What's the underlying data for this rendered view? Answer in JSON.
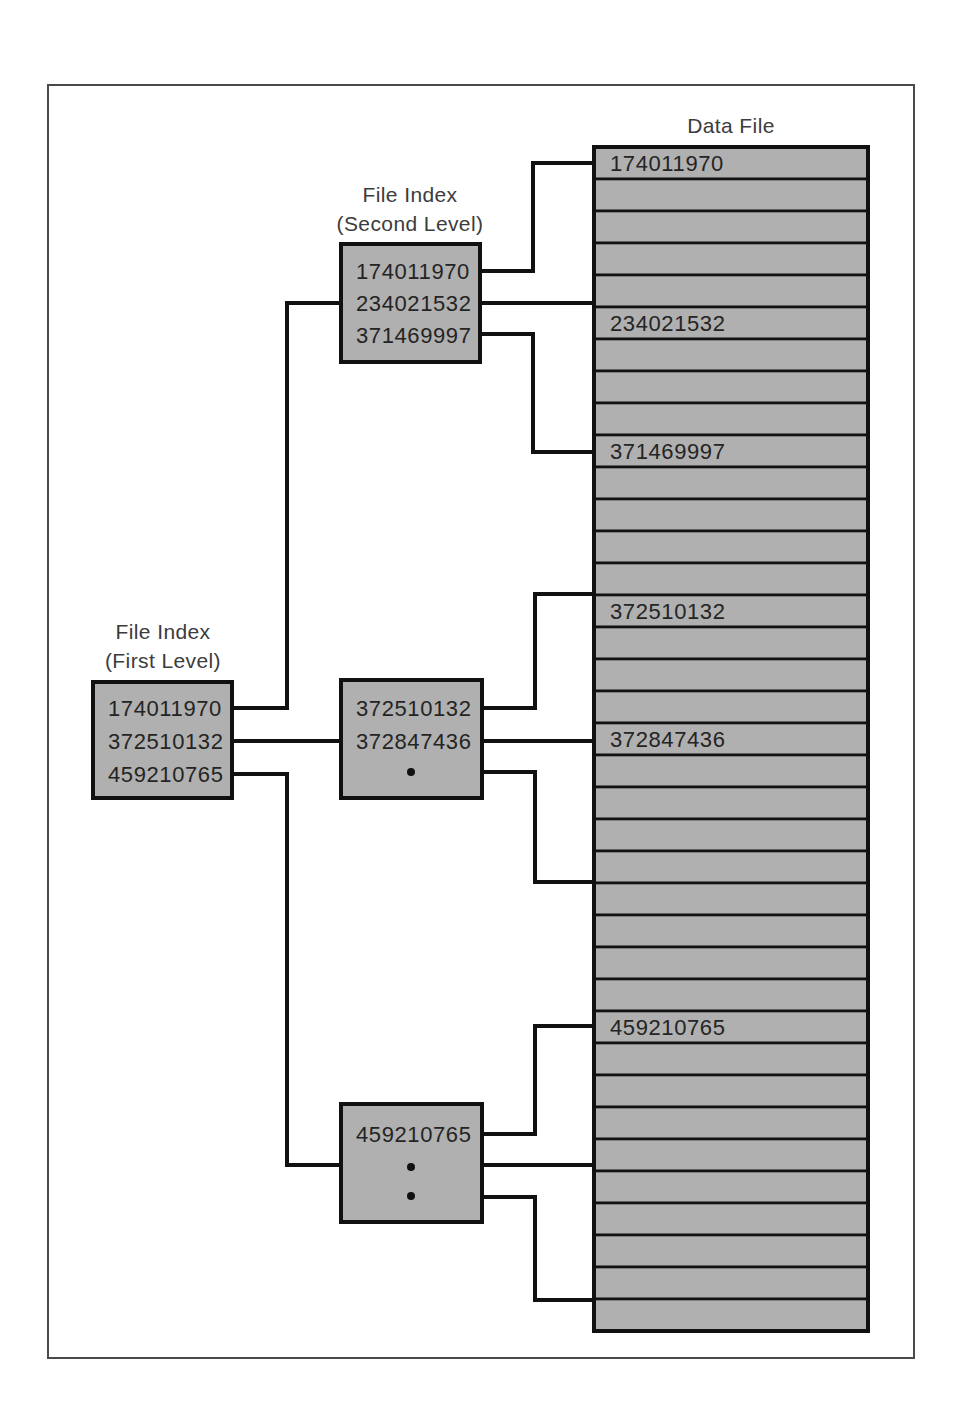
{
  "diagram": {
    "title_labels": {
      "first_level": "File Index\n(First Level)",
      "first_level_line1": "File Index",
      "first_level_line2": "(First Level)",
      "second_level_line1": "File Index",
      "second_level_line2": "(Second Level)",
      "data_file": "Data File"
    },
    "colors": {
      "box_fill": "#b0b0b0",
      "box_stroke": "#111111",
      "frame_stroke": "#4a4a4a",
      "text": "#242424",
      "caption_text": "#3c3c3c",
      "background": "#ffffff"
    },
    "first_level_index": {
      "caption_line1": "File Index",
      "caption_line2": "(First Level)",
      "entries": [
        {
          "label": "174011970",
          "kind": "key"
        },
        {
          "label": "372510132",
          "kind": "key"
        },
        {
          "label": "459210765",
          "kind": "key"
        }
      ]
    },
    "second_level_indexes": [
      {
        "name": "second-level-index-top",
        "caption_line1": "File Index",
        "caption_line2": "(Second Level)",
        "entries": [
          {
            "label": "174011970",
            "kind": "key"
          },
          {
            "label": "234021532",
            "kind": "key"
          },
          {
            "label": "371469997",
            "kind": "key"
          }
        ]
      },
      {
        "name": "second-level-index-middle",
        "caption_line1": "",
        "caption_line2": "",
        "entries": [
          {
            "label": "372510132",
            "kind": "key"
          },
          {
            "label": "372847436",
            "kind": "key"
          },
          {
            "label": "",
            "kind": "ellipsis"
          }
        ]
      },
      {
        "name": "second-level-index-bottom",
        "caption_line1": "",
        "caption_line2": "",
        "entries": [
          {
            "label": "459210765",
            "kind": "key"
          },
          {
            "label": "",
            "kind": "ellipsis"
          },
          {
            "label": "",
            "kind": "ellipsis"
          }
        ]
      }
    ],
    "data_file": {
      "caption": "Data File",
      "total_rows": 37,
      "labeled_rows": [
        {
          "row_index": 0,
          "label": "174011970"
        },
        {
          "row_index": 5,
          "label": "234021532"
        },
        {
          "row_index": 9,
          "label": "371469997"
        },
        {
          "row_index": 14,
          "label": "372510132"
        },
        {
          "row_index": 19,
          "label": "372847436"
        },
        {
          "row_index": 28,
          "label": "459210765"
        }
      ]
    }
  }
}
